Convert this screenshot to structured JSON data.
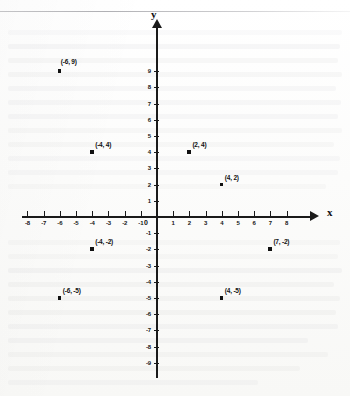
{
  "axes": {
    "x_label": "x",
    "y_label": "y",
    "origin_label": "0"
  },
  "chart_data": {
    "type": "scatter",
    "title": "",
    "xlabel": "x",
    "ylabel": "y",
    "xlim": [
      -8,
      8
    ],
    "ylim": [
      -9,
      9
    ],
    "grid": false,
    "legend": "none",
    "x_ticks": [
      "-8",
      "-7",
      "-6",
      "-5",
      "-4",
      "-3",
      "-2",
      "-1",
      "1",
      "2",
      "3",
      "4",
      "5",
      "6",
      "7",
      "8"
    ],
    "y_ticks": [
      "9",
      "8",
      "7",
      "6",
      "5",
      "4",
      "3",
      "2",
      "1",
      "-1",
      "-2",
      "-3",
      "-4",
      "-5",
      "-6",
      "-7",
      "-8",
      "-9"
    ],
    "points": [
      {
        "x": -6,
        "y": 9,
        "label": "(-6, 9)",
        "stacked": true
      },
      {
        "x": -4,
        "y": 4,
        "label": "(-4, 4)",
        "stacked": false
      },
      {
        "x": 2,
        "y": 4,
        "label": "(2, 4)",
        "stacked": false
      },
      {
        "x": 4,
        "y": 2,
        "label": "(4, 2)",
        "stacked": false
      },
      {
        "x": -4,
        "y": -2,
        "label": "(-4, -2)",
        "stacked": false
      },
      {
        "x": 7,
        "y": -2,
        "label": "(7, -2)",
        "stacked": false
      },
      {
        "x": -6,
        "y": -5,
        "label": "(-6, -5)",
        "stacked": false
      },
      {
        "x": 4,
        "y": -5,
        "label": "(4, -5)",
        "stacked": false
      }
    ]
  }
}
